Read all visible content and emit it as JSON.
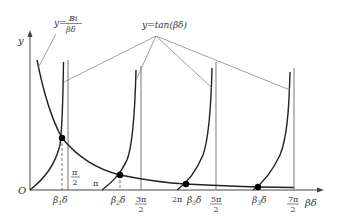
{
  "diagram": {
    "type": "function-plot",
    "axes": {
      "y_label": "y",
      "x_label": "βδ",
      "origin_label": "O"
    },
    "curve_labels": {
      "hyperbola_prefix": "y=",
      "hyperbola_num": "Bi",
      "hyperbola_den": "βδ",
      "tangent": "y=tan(βδ)"
    },
    "x_ticks": [
      {
        "num": "π",
        "den": "2",
        "label": "π/2"
      },
      {
        "num": "",
        "den": "",
        "label": "π"
      },
      {
        "num": "3π",
        "den": "2",
        "label": "3π/2"
      },
      {
        "num": "",
        "den": "",
        "label": "2π"
      },
      {
        "num": "5π",
        "den": "2",
        "label": "5π/2"
      },
      {
        "num": "7π",
        "den": "2",
        "label": "7π/2"
      }
    ],
    "roots": [
      {
        "base": "β",
        "sub": "1",
        "tail": "δ"
      },
      {
        "base": "β",
        "sub": "2",
        "tail": "δ"
      },
      {
        "base": "β",
        "sub": "3",
        "tail": "δ"
      },
      {
        "base": "β",
        "sub": "3",
        "tail": "δ"
      }
    ],
    "colors": {
      "curve": "#222222",
      "asymptote": "#777777",
      "leader": "#888888",
      "point": "#000000"
    }
  }
}
